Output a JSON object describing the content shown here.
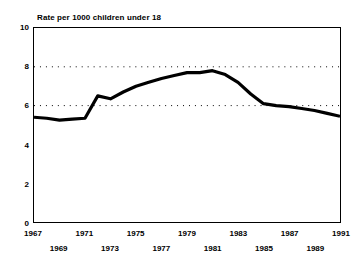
{
  "chart_data": {
    "type": "line",
    "title": "Rate per 1000 children under 18",
    "xlabel": "",
    "ylabel": "",
    "ylim": [
      0,
      10
    ],
    "xlim": [
      1967,
      1991
    ],
    "grid": true,
    "grid_values": [
      6,
      8
    ],
    "grid_style": "dotted",
    "legend": "none",
    "y_ticks": [
      10,
      8,
      6,
      4,
      2,
      0
    ],
    "y_tick_labels": [
      "10",
      "8",
      "6",
      "4",
      "2",
      "0"
    ],
    "x_ticks": [
      1967,
      1969,
      1971,
      1973,
      1975,
      1977,
      1979,
      1981,
      1983,
      1985,
      1987,
      1989,
      1991
    ],
    "x_tick_labels": [
      "1967",
      "1969",
      "1971",
      "1973",
      "1975",
      "1977",
      "1979",
      "1981",
      "1983",
      "1985",
      "1987",
      "1989",
      "1991"
    ],
    "x_tick_rows": [
      "top",
      "bottom",
      "top",
      "bottom",
      "top",
      "bottom",
      "top",
      "bottom",
      "top",
      "bottom",
      "top",
      "bottom",
      "top"
    ],
    "line_color": "#000000",
    "line_width": 3.2,
    "x": [
      1967,
      1968,
      1969,
      1970,
      1971,
      1972,
      1973,
      1974,
      1975,
      1976,
      1977,
      1978,
      1979,
      1980,
      1981,
      1982,
      1983,
      1984,
      1985,
      1986,
      1987,
      1988,
      1989,
      1990,
      1991
    ],
    "values": [
      5.4,
      5.35,
      5.25,
      5.3,
      5.35,
      6.5,
      6.35,
      6.7,
      7.0,
      7.2,
      7.4,
      7.55,
      7.7,
      7.7,
      7.8,
      7.6,
      7.2,
      6.6,
      6.1,
      6.0,
      5.95,
      5.85,
      5.75,
      5.6,
      5.45
    ]
  },
  "axes": {
    "y_labels": [
      "10",
      "8",
      "6",
      "4",
      "2",
      "0"
    ],
    "x_labels_top": [
      "1967",
      "1971",
      "1975",
      "1979",
      "1983",
      "1987",
      "1991"
    ],
    "x_labels_bottom": [
      "1969",
      "1973",
      "1977",
      "1981",
      "1985",
      "1989"
    ]
  }
}
